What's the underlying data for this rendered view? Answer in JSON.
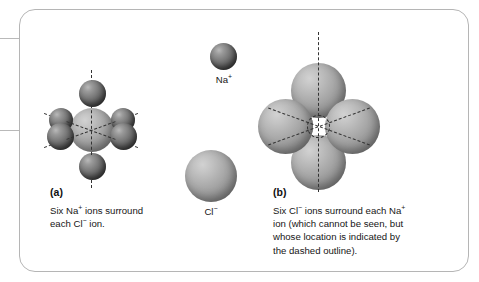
{
  "figure": {
    "panels": [
      {
        "letter": "(a)",
        "caption": "Six Na+ ions surround\neach Cl− ion.",
        "caption_line1_pre": "Six Na",
        "caption_line1_sup": "+",
        "caption_line1_post": " ions surround",
        "caption_line2_pre": "each Cl",
        "caption_line2_sup": "−",
        "caption_line2_post": " ion.",
        "central_ion": "Cl−",
        "surrounding_ion": "Na+",
        "coordination_number": 6
      },
      {
        "letter": "(b)",
        "caption": "Six Cl− ions surround each Na+\nion (which cannot be seen, but\nwhose location is indicated by\nthe dashed outline).",
        "caption_line1_pre": "Six Cl",
        "caption_line1_sup1": "−",
        "caption_line1_mid": " ions surround each Na",
        "caption_line1_sup2": "+",
        "caption_line2": "ion (which cannot be seen, but",
        "caption_line3": "whose location is indicated by",
        "caption_line4": "the dashed outline).",
        "central_ion": "Na+",
        "surrounding_ion": "Cl−",
        "coordination_number": 6
      }
    ],
    "legend": [
      {
        "name": "sodium-ion",
        "label_pre": "Na",
        "label_sup": "+",
        "label": "Na+",
        "size": "small",
        "color": "#6e6e6e"
      },
      {
        "name": "chloride-ion",
        "label_pre": "Cl",
        "label_sup": "−",
        "label": "Cl−",
        "size": "large",
        "color": "#a0a0a0"
      }
    ],
    "colors": {
      "frame_border": "#b5b5b5",
      "background": "#ffffff",
      "sodium": "#6e6e6e",
      "chloride": "#a0a0a0",
      "axis_dash": "#333333",
      "text": "#151515"
    }
  }
}
